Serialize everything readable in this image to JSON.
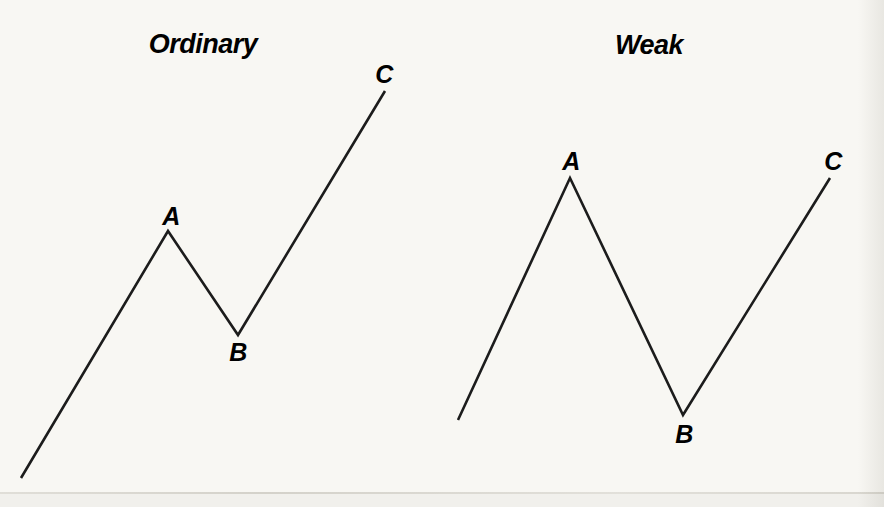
{
  "colors": {
    "background": "#f8f7f3",
    "ink": "#1c1c1c",
    "scan_rule": "#a8a498"
  },
  "diagrams": [
    {
      "id": "ordinary",
      "title": "Ordinary",
      "title_pos": {
        "x": 203,
        "y": 44
      },
      "points": [
        [
          21,
          478
        ],
        [
          168,
          231
        ],
        [
          238,
          335
        ],
        [
          385,
          91
        ]
      ],
      "labels": [
        {
          "text": "A",
          "x": 171,
          "y": 216
        },
        {
          "text": "B",
          "x": 238,
          "y": 352
        },
        {
          "text": "C",
          "x": 384,
          "y": 74
        }
      ]
    },
    {
      "id": "weak",
      "title": "Weak",
      "title_pos": {
        "x": 649,
        "y": 45
      },
      "points": [
        [
          458,
          420
        ],
        [
          570,
          178
        ],
        [
          683,
          415
        ],
        [
          830,
          178
        ]
      ],
      "labels": [
        {
          "text": "A",
          "x": 571,
          "y": 161
        },
        {
          "text": "B",
          "x": 684,
          "y": 434
        },
        {
          "text": "C",
          "x": 833,
          "y": 161
        }
      ]
    }
  ]
}
